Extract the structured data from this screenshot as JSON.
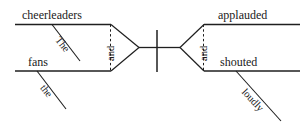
{
  "diagram": {
    "type": "reed-kellogg-sentence-diagram",
    "sentence": "The cheerleaders and the fans applauded and shouted loudly.",
    "stroke_color": "#1f1f1f",
    "background_color": "#ffffff",
    "subjects": {
      "compound": true,
      "conjunction": "and",
      "items": [
        {
          "word": "cheerleaders",
          "modifier": "The"
        },
        {
          "word": "fans",
          "modifier": "the"
        }
      ]
    },
    "predicates": {
      "compound": true,
      "conjunction": "and",
      "items": [
        {
          "word": "applauded",
          "modifier": ""
        },
        {
          "word": "shouted",
          "modifier": "loudly"
        }
      ]
    },
    "labels": {
      "subject_one": "cheerleaders",
      "subject_one_modifier": "The",
      "subject_two": "fans",
      "subject_two_modifier": "the",
      "subject_conjunction": "and",
      "predicate_one": "applauded",
      "predicate_two": "shouted",
      "predicate_two_modifier": "loudly",
      "predicate_conjunction": "and"
    }
  }
}
